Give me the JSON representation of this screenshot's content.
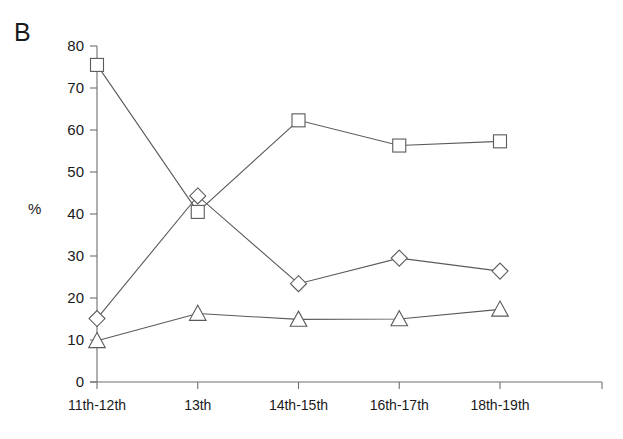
{
  "figure": {
    "panel_label": "B",
    "y_axis_title": "%"
  },
  "chart_data": {
    "type": "line",
    "title": "",
    "subtitle": "",
    "xlabel": "",
    "ylabel": "%",
    "categories": [
      "11th-12th",
      "13th",
      "14th-15th",
      "16th-17th",
      "18th-19th"
    ],
    "ylim": [
      0,
      80
    ],
    "yticks": [
      0,
      10,
      20,
      30,
      40,
      50,
      60,
      70,
      80
    ],
    "ytick_labels": [
      "0",
      "10",
      "20",
      "30",
      "40",
      "50",
      "60",
      "70",
      "80"
    ],
    "grid": false,
    "legend": "none",
    "series": [
      {
        "name": "square-series",
        "marker": "square",
        "color": "#5a5a5a",
        "values": [
          75.5,
          40.5,
          62.3,
          56.3,
          57.3
        ]
      },
      {
        "name": "diamond-series",
        "marker": "diamond",
        "color": "#5a5a5a",
        "values": [
          15.1,
          44.3,
          23.4,
          29.5,
          26.4
        ]
      },
      {
        "name": "triangle-series",
        "marker": "triangle",
        "color": "#5a5a5a",
        "values": [
          9.8,
          16.3,
          14.9,
          15.0,
          17.3
        ]
      }
    ]
  }
}
